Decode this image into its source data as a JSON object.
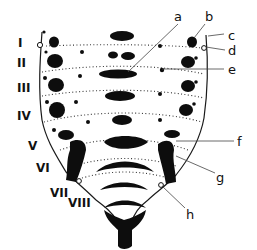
{
  "figure": {
    "segment_labels": [
      "I",
      "II",
      "III",
      "IV",
      "V",
      "VI",
      "VII",
      "VIII"
    ],
    "part_labels": [
      "a",
      "b",
      "c",
      "d",
      "e",
      "f",
      "g",
      "h"
    ],
    "colors": {
      "ink": "#0d0d0d",
      "background": "#ffffff"
    }
  }
}
